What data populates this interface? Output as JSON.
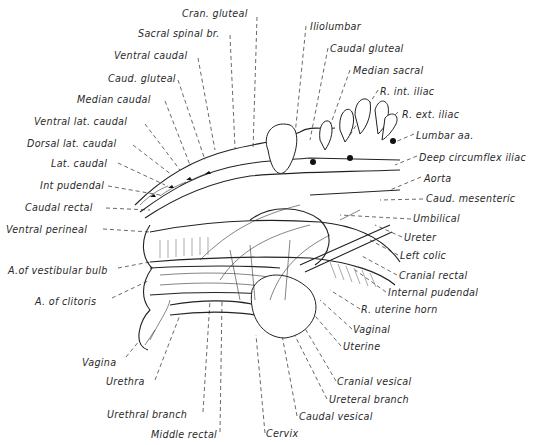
{
  "figure": {
    "type": "anatomical illustration",
    "labels_left": [
      {
        "id": "cran-gluteal",
        "text": "Cran. gluteal",
        "x": 182,
        "y": 8
      },
      {
        "id": "sacral-spinal-br",
        "text": "Sacral spinal br.",
        "x": 138,
        "y": 28
      },
      {
        "id": "ventral-caudal",
        "text": "Ventral caudal",
        "x": 114,
        "y": 50
      },
      {
        "id": "caud-gluteal",
        "text": "Caud. gluteal",
        "x": 108,
        "y": 73
      },
      {
        "id": "median-caudal",
        "text": "Median caudal",
        "x": 77,
        "y": 94
      },
      {
        "id": "ventral-lat-caudal",
        "text": "Ventral lat. caudal",
        "x": 34,
        "y": 116
      },
      {
        "id": "dorsal-lat-caudal",
        "text": "Dorsal lat. caudal",
        "x": 27,
        "y": 138
      },
      {
        "id": "lat-caudal",
        "text": "Lat. caudal",
        "x": 51,
        "y": 158
      },
      {
        "id": "int-pudendal",
        "text": "Int pudendal",
        "x": 40,
        "y": 180
      },
      {
        "id": "caudal-rectal",
        "text": "Caudal rectal",
        "x": 25,
        "y": 202
      },
      {
        "id": "ventral-perineal",
        "text": "Ventral perineal",
        "x": 6,
        "y": 224
      },
      {
        "id": "a-of-vestibular-bulb",
        "text": "A.of vestibular bulb",
        "x": 8,
        "y": 265
      },
      {
        "id": "a-of-clitoris",
        "text": "A. of clitoris",
        "x": 35,
        "y": 296
      }
    ],
    "labels_right": [
      {
        "id": "iliolumbar",
        "text": "Iliolumbar",
        "x": 310,
        "y": 21
      },
      {
        "id": "caudal-gluteal",
        "text": "Caudal gluteal",
        "x": 330,
        "y": 43
      },
      {
        "id": "median-sacral",
        "text": "Median sacral",
        "x": 353,
        "y": 65
      },
      {
        "id": "r-int-iliac",
        "text": "R. int. iliac",
        "x": 380,
        "y": 86
      },
      {
        "id": "r-ext-iliac",
        "text": "R. ext. iliac",
        "x": 402,
        "y": 109
      },
      {
        "id": "lumbar-aa",
        "text": "Lumbar aa.",
        "x": 416,
        "y": 130
      },
      {
        "id": "deep-circumflex-iliac",
        "text": "Deep circumflex iliac",
        "x": 419,
        "y": 152
      },
      {
        "id": "aorta",
        "text": "Aorta",
        "x": 424,
        "y": 173
      },
      {
        "id": "caud-mesenteric",
        "text": "Caud. mesenteric",
        "x": 426,
        "y": 193
      },
      {
        "id": "umbilical",
        "text": "Umbilical",
        "x": 413,
        "y": 213
      },
      {
        "id": "ureter",
        "text": "Ureter",
        "x": 404,
        "y": 232
      },
      {
        "id": "left-colic",
        "text": "Left colic",
        "x": 400,
        "y": 250
      },
      {
        "id": "cranial-rectal",
        "text": "Cranial rectal",
        "x": 399,
        "y": 270
      },
      {
        "id": "internal-pudendal",
        "text": "Internal pudendal",
        "x": 388,
        "y": 287
      },
      {
        "id": "r-uterine-horn",
        "text": "R. uterine horn",
        "x": 361,
        "y": 304
      },
      {
        "id": "vaginal",
        "text": "Vaginal",
        "x": 353,
        "y": 324
      },
      {
        "id": "uterine",
        "text": "Uterine",
        "x": 343,
        "y": 341
      },
      {
        "id": "cranial-vesical",
        "text": "Cranial vesical",
        "x": 337,
        "y": 376
      },
      {
        "id": "ureteral-branch",
        "text": "Ureteral branch",
        "x": 329,
        "y": 394
      },
      {
        "id": "caudal-vesical",
        "text": "Caudal vesical",
        "x": 299,
        "y": 411
      },
      {
        "id": "cervix",
        "text": "Cervix",
        "x": 266,
        "y": 428
      }
    ],
    "labels_bottom": [
      {
        "id": "vagina",
        "text": "Vagina",
        "x": 82,
        "y": 357
      },
      {
        "id": "urethra",
        "text": "Urethra",
        "x": 106,
        "y": 376
      },
      {
        "id": "urethral-branch",
        "text": "Urethral branch",
        "x": 107,
        "y": 409
      },
      {
        "id": "middle-rectal",
        "text": "Middle rectal",
        "x": 151,
        "y": 429
      }
    ]
  }
}
